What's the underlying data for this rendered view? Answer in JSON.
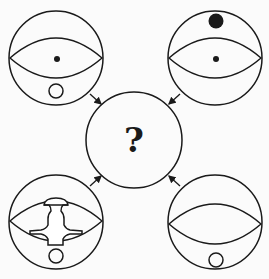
{
  "diagram": {
    "type": "visual-reasoning-puzzle",
    "center": {
      "label": "?"
    },
    "panels": [
      {
        "position": "top-left",
        "elements": [
          "outer-circle",
          "eye-lens",
          "center-dot",
          "bottom-small-circle"
        ]
      },
      {
        "position": "top-right",
        "elements": [
          "outer-circle",
          "eye-lens",
          "center-dot",
          "top-large-dot"
        ]
      },
      {
        "position": "bottom-left",
        "elements": [
          "outer-circle",
          "eye-lens",
          "keyhole-cross-shape",
          "bottom-small-circle"
        ]
      },
      {
        "position": "bottom-right",
        "elements": [
          "outer-circle",
          "eye-lens",
          "bottom-small-circle"
        ]
      }
    ],
    "arrows": [
      {
        "from": "top-left",
        "to": "center"
      },
      {
        "from": "top-right",
        "to": "center"
      },
      {
        "from": "bottom-left",
        "to": "center"
      },
      {
        "from": "bottom-right",
        "to": "center"
      }
    ],
    "colors": {
      "stroke": "#1a1a1a",
      "fill": "#ffffff",
      "background": "#fbfbfb"
    }
  }
}
